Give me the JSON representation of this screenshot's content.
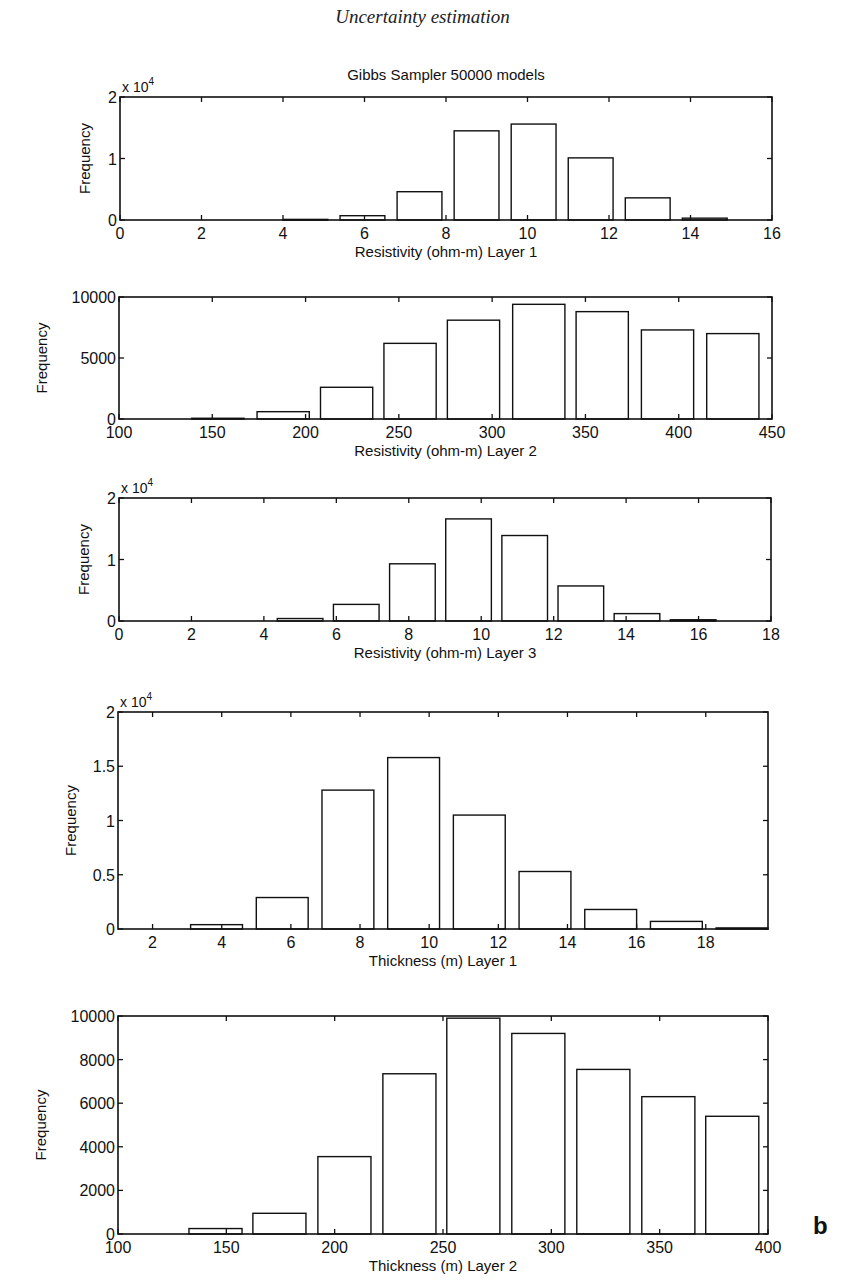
{
  "page_header": "Uncertainty estimation",
  "figure_title": "Gibbs Sampler 50000 models",
  "panel_letter": "b",
  "colors": {
    "axis": "#111111",
    "bar_fill": "#ffffff",
    "bar_stroke": "#111111",
    "background": "#ffffff"
  },
  "chart_data": [
    {
      "type": "bar",
      "title": "Gibbs Sampler 50000 models",
      "xlabel": "Resistivity (ohm-m) Layer 1",
      "ylabel": "Frequency",
      "y_multiplier": "x 10^4",
      "xlim": [
        0,
        16
      ],
      "ylim": [
        0,
        20000
      ],
      "xticks": [
        0,
        2,
        4,
        6,
        8,
        10,
        12,
        14,
        16
      ],
      "yticks": [
        0,
        10000,
        20000
      ],
      "ytick_labels": [
        "0",
        "1",
        "2"
      ],
      "bin_width": 1.1,
      "x": [
        4.55,
        5.95,
        7.35,
        8.75,
        10.15,
        11.55,
        12.95,
        14.35
      ],
      "values": [
        100,
        700,
        4600,
        14500,
        15600,
        10100,
        3600,
        300
      ],
      "grid": false,
      "box": {
        "left": 120,
        "top": 97,
        "right": 772,
        "bottom": 220
      }
    },
    {
      "type": "bar",
      "title": "",
      "xlabel": "Resistivity (ohm-m) Layer 2",
      "ylabel": "Frequency",
      "y_multiplier": "",
      "xlim": [
        100,
        450
      ],
      "ylim": [
        0,
        10000
      ],
      "xticks": [
        100,
        150,
        200,
        250,
        300,
        350,
        400,
        450
      ],
      "yticks": [
        0,
        5000,
        10000
      ],
      "ytick_labels": [
        "0",
        "5000",
        "10000"
      ],
      "bin_width": 28,
      "x": [
        153,
        188,
        222,
        256,
        290,
        325,
        359,
        394,
        429
      ],
      "values": [
        60,
        600,
        2600,
        6200,
        8100,
        9400,
        8800,
        7300,
        7000
      ],
      "grid": false,
      "box": {
        "left": 119,
        "top": 297,
        "right": 772,
        "bottom": 419
      }
    },
    {
      "type": "bar",
      "title": "",
      "xlabel": "Resistivity (ohm-m) Layer 3",
      "ylabel": "Frequency",
      "y_multiplier": "x 10^4",
      "xlim": [
        0,
        18
      ],
      "ylim": [
        0,
        20000
      ],
      "xticks": [
        0,
        2,
        4,
        6,
        8,
        10,
        12,
        14,
        16,
        18
      ],
      "yticks": [
        0,
        10000,
        20000
      ],
      "ytick_labels": [
        "0",
        "1",
        "2"
      ],
      "bin_width": 1.26,
      "x": [
        5.0,
        6.55,
        8.1,
        9.65,
        11.2,
        12.75,
        14.3,
        15.85
      ],
      "values": [
        400,
        2700,
        9300,
        16600,
        13900,
        5700,
        1200,
        200
      ],
      "grid": false,
      "box": {
        "left": 119,
        "top": 498,
        "right": 771,
        "bottom": 621
      }
    },
    {
      "type": "bar",
      "title": "",
      "xlabel": "Thickness (m) Layer 1",
      "ylabel": "Frequency",
      "y_multiplier": "x 10^4",
      "xlim": [
        1,
        19.8
      ],
      "ylim": [
        0,
        20000
      ],
      "xticks": [
        2,
        4,
        6,
        8,
        10,
        12,
        14,
        16,
        18
      ],
      "yticks": [
        0,
        5000,
        10000,
        15000,
        20000
      ],
      "ytick_labels": [
        "0",
        "0.5",
        "1",
        "1.5",
        "2"
      ],
      "bin_width": 1.5,
      "x": [
        3.85,
        5.75,
        7.65,
        9.55,
        11.45,
        13.35,
        15.25,
        17.15,
        19.05
      ],
      "values": [
        400,
        2900,
        12800,
        15800,
        10500,
        5300,
        1800,
        700,
        100
      ],
      "grid": false,
      "box": {
        "left": 118,
        "top": 712,
        "right": 768,
        "bottom": 929
      }
    },
    {
      "type": "bar",
      "title": "",
      "xlabel": "Thickness (m) Layer 2",
      "ylabel": "Frequency",
      "y_multiplier": "",
      "xlim": [
        100,
        400
      ],
      "ylim": [
        0,
        10000
      ],
      "xticks": [
        100,
        150,
        200,
        250,
        300,
        350,
        400
      ],
      "yticks": [
        0,
        2000,
        4000,
        6000,
        8000,
        10000
      ],
      "ytick_labels": [
        "0",
        "2000",
        "4000",
        "6000",
        "8000",
        "10000"
      ],
      "bin_width": 24.5,
      "x": [
        145,
        174.5,
        204.5,
        234.5,
        264,
        294,
        324,
        354,
        383.5
      ],
      "values": [
        250,
        950,
        3550,
        7350,
        9900,
        9200,
        7550,
        6300,
        5400
      ],
      "grid": false,
      "box": {
        "left": 118,
        "top": 1016,
        "right": 768,
        "bottom": 1234
      }
    }
  ]
}
